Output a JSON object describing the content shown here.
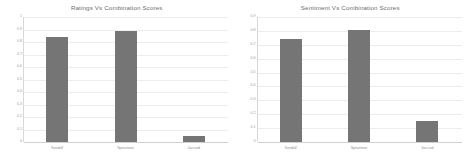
{
  "figure": {
    "background": "#ffffff",
    "bar_color": "#757575",
    "grid_color": "#ededed",
    "axis_color": "#d8d8d8",
    "text_color": "#8f8f8f",
    "title_color": "#6e6e6e"
  },
  "chart_data": [
    {
      "type": "bar",
      "title": "Ratings Vs Combination Scores",
      "categories": [
        "Kendall",
        "Spearman",
        "Jaccard"
      ],
      "values": [
        0.84,
        0.89,
        0.05
      ],
      "xlabel": "",
      "ylabel": "",
      "ylim": [
        0,
        1
      ],
      "yticks": [
        "0",
        "0.1",
        "0.2",
        "0.3",
        "0.4",
        "0.5",
        "0.6",
        "0.7",
        "0.8",
        "0.9",
        "1"
      ],
      "grid": true,
      "legend": "none"
    },
    {
      "type": "bar",
      "title": "Sentiment Vs Combination Scores",
      "categories": [
        "Kendall",
        "Spearman",
        "Jaccard"
      ],
      "values": [
        0.74,
        0.81,
        0.15
      ],
      "xlabel": "",
      "ylabel": "",
      "ylim": [
        0,
        0.9
      ],
      "yticks": [
        "0",
        "0.1",
        "0.2",
        "0.3",
        "0.4",
        "0.5",
        "0.6",
        "0.7",
        "0.8",
        "0.9"
      ],
      "grid": true,
      "legend": "none"
    }
  ]
}
